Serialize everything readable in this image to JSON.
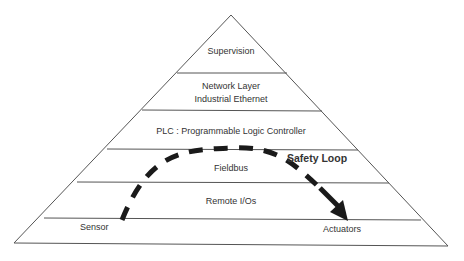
{
  "diagram": {
    "type": "pyramid",
    "colors": {
      "outline": "#555555",
      "text": "#333333",
      "loop": "#1a1a1a",
      "background": "#ffffff"
    },
    "layers": [
      {
        "label": "Supervision"
      },
      {
        "label": "Network Layer",
        "sublabel": "Industrial Ethernet"
      },
      {
        "label": "PLC : Programmable Logic Controller"
      },
      {
        "label": "Fieldbus"
      },
      {
        "label": "Remote I/Os"
      },
      {
        "label": "Sensor",
        "right_label": "Actuators"
      }
    ],
    "safety_loop": {
      "label": "Safety Loop",
      "start": "Sensor",
      "end": "Actuators",
      "style": "dashed-arrow"
    }
  }
}
